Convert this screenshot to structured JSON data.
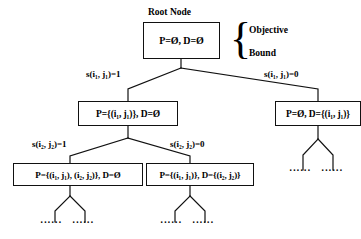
{
  "diagram": {
    "root_caption": "Root Node",
    "bracket": {
      "line1": "Objective",
      "line2": "Bound"
    },
    "nodes": {
      "root": "P=Ø, D=Ø",
      "level2_left": "P={(i₁, j₁)}, D=Ø",
      "level2_right": "P=Ø, D={(i₁, j₁)}",
      "level3_left": "P={(i₁, j₁), (i₂, j₂)}, D=Ø",
      "level3_right": "P={(i₁, j₁)}, D={(i₂, j₂)}"
    },
    "edge_labels": {
      "root_left": "s(i₁, j₁)=1",
      "root_right": "s(i₁, j₁)=0",
      "level2_left": "s(i₂, j₂)=1",
      "level2_right": "s(i₂, j₂)=0"
    },
    "ellipses": {
      "e1": "······",
      "e2": "······",
      "e3": "······",
      "e4": "······",
      "e5": "······",
      "e6": "······"
    },
    "colors": {
      "stroke": "#111111",
      "text": "#000000",
      "background": "#ffffff"
    }
  }
}
